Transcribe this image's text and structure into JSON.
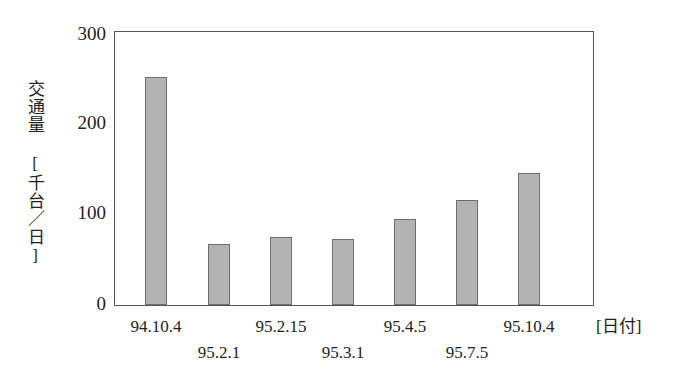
{
  "chart_data": {
    "type": "bar",
    "title": "",
    "xlabel": "[日付]",
    "ylabel": "交通量 [千台／日]",
    "categories": [
      "94.10.4",
      "95.2.1",
      "95.2.15",
      "95.3.1",
      "95.4.5",
      "95.7.5",
      "95.10.4"
    ],
    "values": [
      250,
      67,
      75,
      72,
      94,
      115,
      145
    ],
    "ylim": [
      0,
      300
    ],
    "yticks": [
      0,
      100,
      200,
      300
    ],
    "ytick_labels": [
      "0",
      "100",
      "200",
      "300"
    ],
    "grid": false,
    "legend": null,
    "bar_color": "#b3b3b3",
    "bar_edge_color": "#6e6e6e",
    "axis_color": "#555555",
    "label_rows": [
      {
        "row": 0,
        "indices": [
          0,
          2,
          4,
          6
        ]
      },
      {
        "row": 1,
        "indices": [
          1,
          3,
          5
        ]
      }
    ]
  }
}
